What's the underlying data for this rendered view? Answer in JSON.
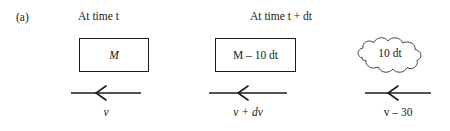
{
  "figure": {
    "part_label": "(a)",
    "headers": {
      "left": "At time t",
      "right": "At time t + dt"
    },
    "boxes": [
      {
        "name": "mass-initial",
        "label": "M"
      },
      {
        "name": "mass-final",
        "label": "M – 10 dt"
      }
    ],
    "cloud": {
      "label": "10 dt"
    },
    "arrows": [
      {
        "name": "velocity-initial",
        "direction": "left",
        "label": "v"
      },
      {
        "name": "velocity-final",
        "direction": "left",
        "label": "v + dv"
      },
      {
        "name": "velocity-exhaust",
        "direction": "left",
        "label": "v – 30"
      }
    ],
    "colors": {
      "ink": "#1a1a1a",
      "background": "#ffffff"
    }
  }
}
